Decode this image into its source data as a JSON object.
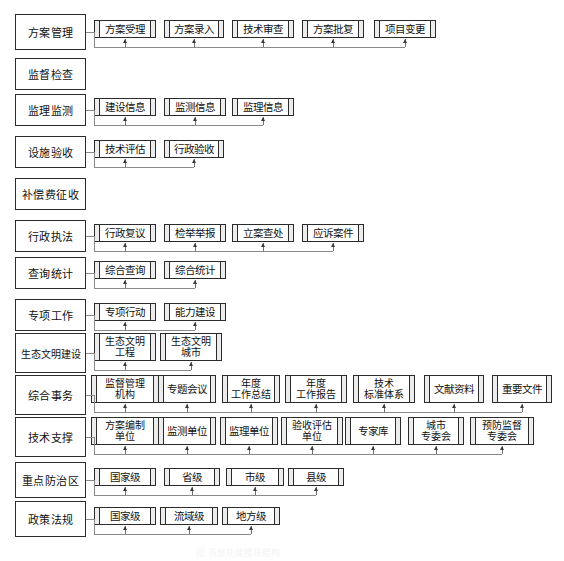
{
  "diagram": {
    "caption": "图      系统功能模块结构",
    "type": "tree-hierarchy",
    "line_color": "#8a8a8a",
    "border_color": "#2b2b2b",
    "rows": [
      {
        "label": "方案管理",
        "nodes": [
          {
            "label": "方案受理"
          },
          {
            "label": "方案录入"
          },
          {
            "label": "技术审查"
          },
          {
            "label": "方案批复"
          },
          {
            "label": "项目变更"
          }
        ]
      },
      {
        "label": "监督检查",
        "nodes": []
      },
      {
        "label": "监理监测",
        "nodes": [
          {
            "label": "建设信息"
          },
          {
            "label": "监测信息"
          },
          {
            "label": "监理信息"
          }
        ]
      },
      {
        "label": "设施验收",
        "nodes": [
          {
            "label": "技术评估"
          },
          {
            "label": "行政验收"
          }
        ]
      },
      {
        "label": "补偿费征收",
        "nodes": []
      },
      {
        "label": "行政执法",
        "nodes": [
          {
            "label": "行政复议"
          },
          {
            "label": "检举举报"
          },
          {
            "label": "立案查处"
          },
          {
            "label": "应诉案件"
          }
        ]
      },
      {
        "label": "查询统计",
        "nodes": [
          {
            "label": "综合查询"
          },
          {
            "label": "综合统计"
          }
        ]
      },
      {
        "label": "专项工作",
        "nodes": [
          {
            "label": "专项行动"
          },
          {
            "label": "能力建设"
          }
        ]
      },
      {
        "label": "生态文明建设",
        "nodes": [
          {
            "label": "生态文明\n工程"
          },
          {
            "label": "生态文明\n城市"
          }
        ]
      },
      {
        "label": "综合事务",
        "nodes": [
          {
            "label": "监督管理\n机构"
          },
          {
            "label": "专题会议"
          },
          {
            "label": "年度\n工作总结"
          },
          {
            "label": "年度\n工作报告"
          },
          {
            "label": "技术\n标准体系"
          },
          {
            "label": "文献资料"
          },
          {
            "label": "重要文件"
          }
        ]
      },
      {
        "label": "技术支撑",
        "nodes": [
          {
            "label": "方案编制\n单位"
          },
          {
            "label": "监测单位"
          },
          {
            "label": "监理单位"
          },
          {
            "label": "验收评估\n单位"
          },
          {
            "label": "专家库"
          },
          {
            "label": "城市\n专委会"
          },
          {
            "label": "预防监督\n专委会"
          }
        ]
      },
      {
        "label": "重点防治区",
        "nodes": [
          {
            "label": "国家级"
          },
          {
            "label": "省级"
          },
          {
            "label": "市级"
          },
          {
            "label": "县级"
          }
        ]
      },
      {
        "label": "政策法规",
        "nodes": [
          {
            "label": "国家级"
          },
          {
            "label": "流域级"
          },
          {
            "label": "地方级"
          }
        ]
      }
    ]
  }
}
